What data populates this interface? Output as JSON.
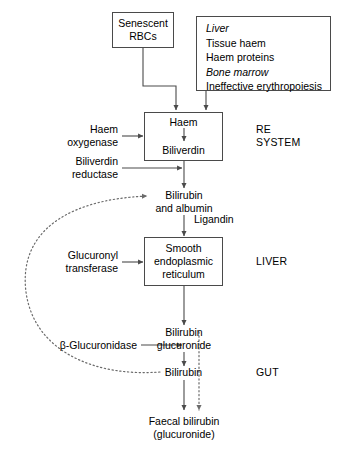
{
  "diagram": {
    "colors": {
      "stroke": "#4a4a4a",
      "text": "#000000",
      "background": "#ffffff",
      "dotted": "#6b6b6b"
    },
    "nodes": {
      "senescent_rbcs": {
        "line1": "Senescent",
        "line2": "RBCs"
      },
      "sources_box": {
        "items": [
          {
            "text": "Liver",
            "style": "italic"
          },
          {
            "text": "Tissue haem",
            "style": "normal"
          },
          {
            "text": "Haem proteins",
            "style": "normal"
          },
          {
            "text": "Bone marrow",
            "style": "italic"
          },
          {
            "text": "Ineffective erythropoiesis",
            "style": "normal"
          }
        ]
      },
      "haem_biliverdin_box": {
        "line1": "Haem",
        "line2": "Biliverdin"
      },
      "bilirubin_albumin": {
        "line1": "Bilirubin",
        "line2": "and albumin"
      },
      "smooth_er_box": {
        "line1": "Smooth",
        "line2": "endoplasmic",
        "line3": "reticulum"
      },
      "bilirubin_glucuronide": {
        "line1": "Bilirubin",
        "line2": "glucuronide"
      },
      "bilirubin_gut": {
        "line1": "Bilirubin"
      },
      "faecal_bilirubin": {
        "line1": "Faecal bilirubin",
        "line2": "(glucuronide)"
      }
    },
    "enzyme_labels": {
      "haem_oxygenase": {
        "line1": "Haem",
        "line2": "oxygenase"
      },
      "biliverdin_reductase": {
        "line1": "Biliverdin",
        "line2": "reductase"
      },
      "ligandin": {
        "line1": "Ligandin"
      },
      "glucuronyl_transferase": {
        "line1": "Glucuronyl",
        "line2": "transferase"
      },
      "beta_glucuronidase": {
        "line1": "β-Glucuronidase"
      }
    },
    "regions": {
      "re_system": {
        "line1": "RE",
        "line2": "SYSTEM"
      },
      "liver": {
        "line1": "LIVER"
      },
      "gut": {
        "line1": "GUT"
      }
    }
  }
}
